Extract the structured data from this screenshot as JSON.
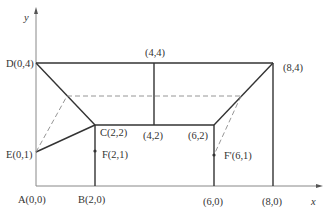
{
  "diagram": {
    "axes": {
      "x_label": "x",
      "y_label": "y"
    },
    "points": {
      "A": {
        "name": "A",
        "coords": "(0,0)",
        "label": "A(0,0)"
      },
      "B": {
        "name": "B",
        "coords": "(2,0)",
        "label": "B(2,0)"
      },
      "C": {
        "name": "C",
        "coords": "(2,2)",
        "label": "C(2,2)"
      },
      "D": {
        "name": "D",
        "coords": "(0,4)",
        "label": "D(0,4)"
      },
      "E": {
        "name": "E",
        "coords": "(0,1)",
        "label": "E(0,1)"
      },
      "F": {
        "name": "F",
        "coords": "(2,1)",
        "label": "F(2,1)"
      },
      "F_prime": {
        "name": "F'",
        "coords": "(6,1)",
        "label": "F'(6,1)"
      },
      "P44": {
        "coords": "(4,4)",
        "label": "(4,4)"
      },
      "P84": {
        "coords": "(8,4)",
        "label": "(8,4)"
      },
      "P42": {
        "coords": "(4,2)",
        "label": "(4,2)"
      },
      "P62": {
        "coords": "(6,2)",
        "label": "(6,2)"
      },
      "P60": {
        "coords": "(6,0)",
        "label": "(6,0)"
      },
      "P80": {
        "coords": "(8,0)",
        "label": "(8,0)"
      }
    },
    "colors": {
      "line": "#333333",
      "axis": "#888888",
      "dashed": "#8a8a8a",
      "text": "#333333",
      "background": "#ffffff"
    }
  }
}
